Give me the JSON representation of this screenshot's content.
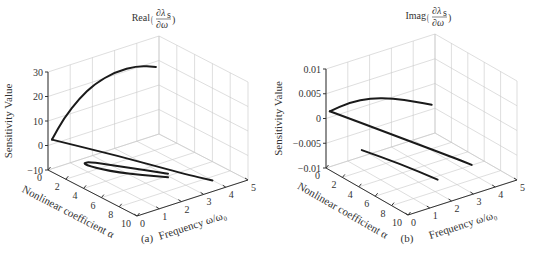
{
  "figure": {
    "panels": [
      {
        "id": "a",
        "panel_label": "(a)",
        "title_prefix": "Real",
        "title_frac_num": "∂λ",
        "title_frac_sub": "s",
        "title_frac_den": "∂ω",
        "zlabel": "Sensitivity Value",
        "alabel": "Nonlinear coefficient α",
        "wlabel": "Frequency ω/ω₀",
        "ztick_labels": [
          "−10",
          "0",
          "10",
          "20",
          "30"
        ],
        "atick_labels": [
          "0",
          "2",
          "4",
          "6",
          "8",
          "10"
        ],
        "wtick_labels": [
          "0",
          "1",
          "2",
          "3",
          "4",
          "5"
        ]
      },
      {
        "id": "b",
        "panel_label": "(b)",
        "title_prefix": "Imag",
        "title_frac_num": "∂λ",
        "title_frac_sub": "s",
        "title_frac_den": "∂ω",
        "zlabel": "Sensitivity Value",
        "alabel": "Nonlinear coefficient α",
        "wlabel": "Frequency ω/ω₀",
        "ztick_labels": [
          "−0.01",
          "−0.005",
          "0",
          "0.005",
          "0.01"
        ],
        "atick_labels": [
          "0",
          "2",
          "4",
          "6",
          "8",
          "10"
        ],
        "wtick_labels": [
          "0",
          "1",
          "2",
          "3",
          "4",
          "5"
        ]
      }
    ]
  },
  "chart_data": [
    {
      "type": "line3d",
      "title": "Real(∂λs/∂ω)",
      "xlabel": "Nonlinear coefficient α",
      "ylabel": "Frequency ω/ω₀",
      "zlabel": "Sensitivity Value",
      "xlim": [
        0,
        10
      ],
      "ylim": [
        0,
        5
      ],
      "zlim": [
        -10,
        30
      ],
      "xticks": [
        0,
        2,
        4,
        6,
        8,
        10
      ],
      "yticks": [
        0,
        1,
        2,
        3,
        4,
        5
      ],
      "zticks": [
        -10,
        0,
        10,
        20,
        30
      ],
      "grid": true,
      "series": [
        {
          "name": "upper branch",
          "points": [
            [
              0.2,
              0.1,
              2.5
            ],
            [
              0.3,
              0.6,
              10
            ],
            [
              0.3,
              1.3,
              16
            ],
            [
              0.2,
              2.0,
              19.5
            ],
            [
              0.1,
              3.0,
              21.5
            ],
            [
              0.1,
              4.0,
              21
            ],
            [
              0.4,
              4.7,
              19
            ]
          ]
        },
        {
          "name": "lower straight branch",
          "points": [
            [
              0.2,
              0.1,
              2.5
            ],
            [
              4.0,
              1.5,
              -1
            ],
            [
              8.0,
              2.9,
              -5
            ],
            [
              9.5,
              3.6,
              -7
            ]
          ]
        },
        {
          "name": "loop branch",
          "points": [
            [
              6.5,
              2.8,
              -9
            ],
            [
              4.0,
              1.5,
              -8
            ],
            [
              2.5,
              0.8,
              -6
            ],
            [
              2.2,
              0.7,
              -5
            ],
            [
              2.6,
              0.9,
              -4.5
            ],
            [
              4.5,
              1.6,
              -5
            ],
            [
              7.0,
              2.6,
              -6
            ]
          ]
        }
      ]
    },
    {
      "type": "line3d",
      "title": "Imag(∂λs/∂ω)",
      "xlabel": "Nonlinear coefficient α",
      "ylabel": "Frequency ω/ω₀",
      "zlabel": "Sensitivity Value",
      "xlim": [
        0,
        10
      ],
      "ylim": [
        0,
        5
      ],
      "zlim": [
        -0.01,
        0.01
      ],
      "xticks": [
        0,
        2,
        4,
        6,
        8,
        10
      ],
      "yticks": [
        0,
        1,
        2,
        3,
        4,
        5
      ],
      "zticks": [
        -0.01,
        -0.005,
        0,
        0.005,
        0.01
      ],
      "grid": true,
      "series": [
        {
          "name": "upper curve",
          "points": [
            [
              0.2,
              0.1,
              0.0015
            ],
            [
              0.2,
              1.0,
              0.002
            ],
            [
              0.2,
              2.0,
              0.0015
            ],
            [
              0.2,
              3.0,
              0.0
            ],
            [
              0.3,
              4.0,
              -0.002
            ],
            [
              0.4,
              4.7,
              -0.0035
            ]
          ]
        },
        {
          "name": "middle line",
          "points": [
            [
              0.2,
              0.1,
              0.0015
            ],
            [
              4.0,
              1.5,
              -0.0015
            ],
            [
              8.0,
              2.9,
              -0.0045
            ],
            [
              9.0,
              3.3,
              -0.0055
            ]
          ]
        },
        {
          "name": "lower line",
          "points": [
            [
              2.5,
              0.7,
              -0.005
            ],
            [
              5.0,
              1.5,
              -0.0065
            ],
            [
              7.5,
              2.3,
              -0.0085
            ]
          ]
        }
      ]
    }
  ],
  "projection": [
    {
      "origin": [
        48,
        170
      ],
      "avec": [
        89,
        46
      ],
      "wvec": [
        111,
        -36
      ],
      "zpx": 98
    },
    {
      "origin": [
        326,
        168
      ],
      "avec": [
        82,
        47
      ],
      "wvec": [
        109,
        -35
      ],
      "zpx": 99
    }
  ]
}
